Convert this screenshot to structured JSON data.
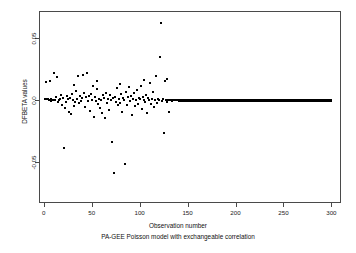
{
  "figure": {
    "background_color": "#ffffff",
    "frame_color": "#4a4a4a",
    "point_color": "#000000"
  },
  "axis": {
    "x_title": "Observation number",
    "y_title": "DFBETA values",
    "caption": "PA-GEE Poisson model with exchangeable correlation",
    "x_tick_labels": [
      "0",
      "50",
      "100",
      "150",
      "200",
      "250",
      "300"
    ],
    "y_tick_labels": [
      "0.05",
      "0.0",
      "-0.05"
    ]
  },
  "chart_data": {
    "type": "scatter",
    "title": "",
    "subtitle": "PA-GEE Poisson model with exchangeable correlation",
    "xlabel": "Observation number",
    "ylabel": "DFBETA values",
    "xlim": [
      -5,
      310
    ],
    "ylim": [
      -0.083,
      0.072
    ],
    "xticks": [
      0,
      50,
      100,
      150,
      200,
      250,
      300
    ],
    "yticks": [
      0.05,
      0.0,
      -0.05
    ],
    "grid": false,
    "legend": null,
    "marker": "filled-circle",
    "marker_size_px": 2,
    "series": [
      {
        "name": "DFBETA values",
        "note": "Observations 1-140 scattered about zero; observations ~141-300 collapse onto a dense solid line at 0.0",
        "points": [
          [
            1,
            0.0007
          ],
          [
            2,
            0.0149
          ],
          [
            3,
            0.0006
          ],
          [
            4,
            0.0009
          ],
          [
            5,
            0.0004
          ],
          [
            6,
            0.0155
          ],
          [
            7,
            -0.0008
          ],
          [
            8,
            0.0011
          ],
          [
            9,
            0.0002
          ],
          [
            10,
            0.0005
          ],
          [
            11,
            0.0216
          ],
          [
            12,
            0.0001
          ],
          [
            13,
            0.0025
          ],
          [
            14,
            0.0186
          ],
          [
            15,
            -0.0016
          ],
          [
            16,
            0.0003
          ],
          [
            17,
            0.0008
          ],
          [
            18,
            0.0041
          ],
          [
            19,
            -0.0035
          ],
          [
            20,
            0.0019
          ],
          [
            21,
            -0.0382
          ],
          [
            22,
            -0.0065
          ],
          [
            23,
            -0.0011
          ],
          [
            24,
            0.0034
          ],
          [
            25,
            0.0006
          ],
          [
            26,
            -0.0096
          ],
          [
            27,
            0.0021
          ],
          [
            28,
            -0.0112
          ],
          [
            29,
            0.0052
          ],
          [
            30,
            0.0002
          ],
          [
            31,
            0.0126
          ],
          [
            32,
            -0.0043
          ],
          [
            33,
            -0.0018
          ],
          [
            34,
            0.0071
          ],
          [
            35,
            0.0009
          ],
          [
            36,
            0.0193
          ],
          [
            37,
            -0.0026
          ],
          [
            38,
            0.0037
          ],
          [
            39,
            -0.0007
          ],
          [
            40,
            0.0014
          ],
          [
            41,
            0.0207
          ],
          [
            42,
            0.0058
          ],
          [
            43,
            -0.0051
          ],
          [
            44,
            0.0024
          ],
          [
            45,
            0.0223
          ],
          [
            46,
            -0.0009
          ],
          [
            47,
            0.0031
          ],
          [
            48,
            -0.0084
          ],
          [
            49,
            0.0046
          ],
          [
            50,
            0.0003
          ],
          [
            51,
            0.0118
          ],
          [
            52,
            -0.0134
          ],
          [
            53,
            0.0027
          ],
          [
            54,
            -0.0005
          ],
          [
            55,
            0.0088
          ],
          [
            56,
            0.0152
          ],
          [
            57,
            -0.0029
          ],
          [
            58,
            0.0012
          ],
          [
            59,
            -0.0061
          ],
          [
            60,
            0.0004
          ],
          [
            61,
            -0.0104
          ],
          [
            62,
            0.0039
          ],
          [
            63,
            0.0016
          ],
          [
            64,
            -0.0147
          ],
          [
            65,
            0.0061
          ],
          [
            66,
            -0.0022
          ],
          [
            67,
            0.0008
          ],
          [
            68,
            -0.0078
          ],
          [
            69,
            0.0044
          ],
          [
            70,
            0.0002
          ],
          [
            71,
            -0.0337
          ],
          [
            72,
            0.0018
          ],
          [
            73,
            -0.0586
          ],
          [
            74,
            0.0029
          ],
          [
            75,
            -0.0013
          ],
          [
            76,
            0.0095
          ],
          [
            77,
            -0.0041
          ],
          [
            78,
            0.0006
          ],
          [
            79,
            0.0131
          ],
          [
            80,
            -0.0024
          ],
          [
            81,
            0.0051
          ],
          [
            82,
            -0.0097
          ],
          [
            83,
            0.0017
          ],
          [
            84,
            0.0004
          ],
          [
            85,
            -0.0512
          ],
          [
            86,
            0.0069
          ],
          [
            87,
            -0.0036
          ],
          [
            88,
            0.0022
          ],
          [
            89,
            0.0103
          ],
          [
            90,
            -0.0008
          ],
          [
            91,
            0.0035
          ],
          [
            92,
            -0.0118
          ],
          [
            93,
            0.0011
          ],
          [
            94,
            0.0057
          ],
          [
            95,
            -0.0049
          ],
          [
            96,
            0.0003
          ],
          [
            97,
            0.0081
          ],
          [
            98,
            -0.0027
          ],
          [
            99,
            0.0014
          ],
          [
            100,
            0.0006
          ],
          [
            101,
            0.0112
          ],
          [
            102,
            -0.0072
          ],
          [
            103,
            0.0028
          ],
          [
            104,
            0.0001
          ],
          [
            105,
            0.0162
          ],
          [
            106,
            -0.0016
          ],
          [
            107,
            0.0043
          ],
          [
            108,
            -0.0105
          ],
          [
            109,
            0.0019
          ],
          [
            110,
            0.0005
          ],
          [
            111,
            0.0137
          ],
          [
            112,
            -0.0031
          ],
          [
            113,
            0.0009
          ],
          [
            114,
            0.0066
          ],
          [
            115,
            -0.0058
          ],
          [
            116,
            0.0002
          ],
          [
            117,
            0.0198
          ],
          [
            118,
            -0.0021
          ],
          [
            119,
            0.0012
          ],
          [
            120,
            0.0004
          ],
          [
            121,
            0.0347
          ],
          [
            122,
            0.0621
          ],
          [
            123,
            -0.0009
          ],
          [
            124,
            0.0007
          ],
          [
            125,
            -0.0267
          ],
          [
            126,
            0.0153
          ],
          [
            127,
            0.0003
          ],
          [
            128,
            0.0171
          ],
          [
            129,
            -0.0011
          ],
          [
            130,
            0.0005
          ],
          [
            131,
            -0.0092
          ],
          [
            132,
            0.0001
          ],
          [
            133,
            0.0002
          ],
          [
            134,
            -0.0006
          ],
          [
            135,
            0.0003
          ],
          [
            136,
            -0.0002
          ],
          [
            137,
            0.0001
          ],
          [
            138,
            0.0
          ],
          [
            139,
            0.0
          ],
          [
            140,
            0.0
          ]
        ],
        "zero_run": {
          "x_start": 141,
          "x_end": 300,
          "y": 0.0
        }
      }
    ]
  }
}
